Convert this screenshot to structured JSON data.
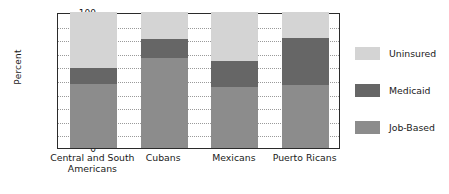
{
  "chart_data": {
    "type": "bar",
    "title": "",
    "subtitle": "",
    "stacked": true,
    "xlabel": "",
    "ylabel": "Percent",
    "ylim": [
      0,
      100
    ],
    "ytick_step": 10,
    "ytick_labels": [
      "100",
      "90",
      "80",
      "70",
      "60",
      "50",
      "40",
      "30",
      "20",
      "10",
      "0"
    ],
    "ytick_values": [
      100,
      90,
      80,
      70,
      60,
      50,
      40,
      30,
      20,
      10,
      0
    ],
    "grid": true,
    "grid_axis": "y",
    "legend_position": "right",
    "categories": [
      "Central and South\nAmericans",
      "Cubans",
      "Mexicans",
      "Puerto Ricans"
    ],
    "series": [
      {
        "name": "Job-Based",
        "color": "#8c8c8c",
        "values": [
          47,
          66,
          45,
          46
        ]
      },
      {
        "name": "Medicaid",
        "color": "#666666",
        "values": [
          12,
          14,
          19,
          35
        ]
      },
      {
        "name": "Uninsured",
        "color": "#d4d4d4",
        "values": [
          41,
          20,
          36,
          19
        ]
      }
    ],
    "cumulative_tops": {
      "job_based": [
        47,
        66,
        45,
        46
      ],
      "medicaid": [
        59,
        80,
        64,
        81
      ],
      "uninsured": [
        100,
        100,
        100,
        100
      ]
    },
    "legend": [
      {
        "label": "Uninsured",
        "color": "#d4d4d4"
      },
      {
        "label": "Medicaid",
        "color": "#666666"
      },
      {
        "label": "Job-Based",
        "color": "#8c8c8c"
      }
    ]
  },
  "colors": {
    "uninsured": "#d4d4d4",
    "medicaid": "#666666",
    "job_based": "#8c8c8c",
    "axis": "#2b2b2b",
    "grid": "#9a9a9a",
    "text": "#1a1a1a",
    "background": "#ffffff"
  }
}
